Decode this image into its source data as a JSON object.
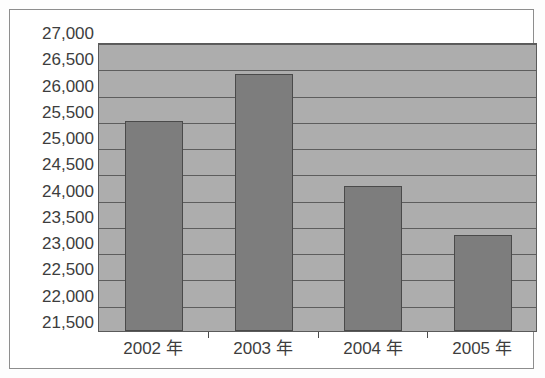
{
  "chart_data": {
    "type": "bar",
    "title": "",
    "subtitle": "",
    "xlabel": "",
    "ylabel": "",
    "categories": [
      "2002 年",
      "2003 年",
      "2004 年",
      "2005 年"
    ],
    "values": [
      25500,
      26400,
      24250,
      23330
    ],
    "series": [
      {
        "name": "",
        "values": [
          25500,
          26400,
          24250,
          23330
        ]
      }
    ],
    "ylim": [
      21500,
      27000
    ],
    "ytick_step": 500,
    "ytick_labels": [
      "27,000",
      "26,500",
      "26,000",
      "25,500",
      "25,000",
      "24,500",
      "24,000",
      "23,500",
      "23,000",
      "22,500",
      "22,000",
      "21,500"
    ],
    "ytick_values": [
      27000,
      26500,
      26000,
      25500,
      25000,
      24500,
      24000,
      23500,
      23000,
      22500,
      22000,
      21500
    ],
    "grid": true,
    "grid_axis": "y",
    "legend": false,
    "legend_position": "none",
    "annotations": [],
    "colors": {
      "bar_fill": "#7d7d7d",
      "bar_border": "#4a4a4a",
      "plot_background": "#adadad",
      "gridline": "#5d5d5d",
      "axis_text": "#3d3d3d",
      "frame_border": "#8d8d8d",
      "figure_background": "#ffffff"
    }
  }
}
